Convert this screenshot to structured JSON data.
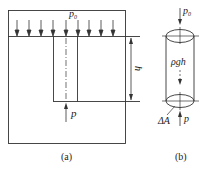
{
  "figure_a": {
    "caption": "(a)",
    "surface_pressure_label": "p",
    "surface_pressure_sub": "0",
    "depth_label": "h",
    "bottom_pressure_label": "p",
    "arrow_count": 9
  },
  "figure_b": {
    "caption": "(b)",
    "top_pressure_label": "p",
    "top_pressure_sub": "0",
    "weight_label": "ρgh",
    "area_label": "ΔA",
    "bottom_pressure_label": "p"
  },
  "colors": {
    "line": "#333333",
    "background": "#ffffff"
  }
}
